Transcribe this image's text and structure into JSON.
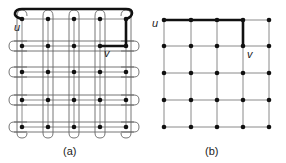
{
  "figure": {
    "panels": [
      {
        "id": "a",
        "caption": "(a)",
        "grid": {
          "cols": [
            22,
            48,
            74,
            100,
            126
          ],
          "rows": [
            19,
            46,
            72,
            100,
            127
          ]
        },
        "labels": {
          "u": "u",
          "v": "v"
        },
        "description": "5x5 grid with a thin closed tour threading the grid and a bold u-v path around the top-right"
      },
      {
        "id": "b",
        "caption": "(b)",
        "grid": {
          "cols": [
            164,
            191,
            217,
            243,
            269
          ],
          "rows": [
            20,
            46,
            73,
            100,
            127
          ]
        },
        "labels": {
          "u": "u",
          "v": "v"
        },
        "description": "5x5 grid with a bold shortest path from u along top row then down to v"
      }
    ],
    "colors": {
      "grid_line": "#8a8a8a",
      "node": "#111111",
      "bold_path": "#111111",
      "tour_line": "#666666"
    }
  }
}
